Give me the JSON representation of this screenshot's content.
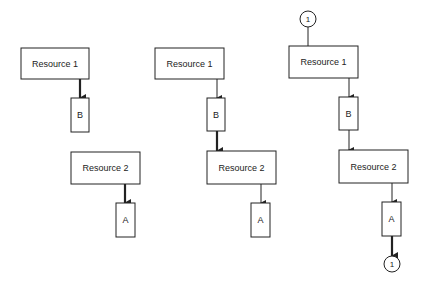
{
  "diagram": {
    "colors": {
      "stroke": "#222222",
      "background": "#ffffff"
    },
    "panels": [
      {
        "id": "left",
        "nodes": [
          {
            "id": "l-r1",
            "type": "resource",
            "label": "Resource 1",
            "x": 21,
            "y": 48,
            "w": 68,
            "h": 31
          },
          {
            "id": "l-b",
            "type": "task",
            "label": "B",
            "x": 71,
            "y": 98,
            "w": 18,
            "h": 34
          },
          {
            "id": "l-r2",
            "type": "resource",
            "label": "Resource 2",
            "x": 71,
            "y": 152,
            "w": 69,
            "h": 32
          },
          {
            "id": "l-a",
            "type": "task",
            "label": "A",
            "x": 116,
            "y": 203,
            "w": 19,
            "h": 34
          }
        ],
        "edges": [
          {
            "from": "l-r1",
            "to": "l-b",
            "x": 80,
            "y1": 79,
            "y2": 98,
            "thick": true
          },
          {
            "from": "l-r2",
            "to": "l-a",
            "x": 125,
            "y1": 184,
            "y2": 203,
            "thick": true
          }
        ]
      },
      {
        "id": "middle",
        "nodes": [
          {
            "id": "m-r1",
            "type": "resource",
            "label": "Resource 1",
            "x": 155,
            "y": 48,
            "w": 69,
            "h": 31
          },
          {
            "id": "m-b",
            "type": "task",
            "label": "B",
            "x": 207,
            "y": 98,
            "w": 18,
            "h": 33
          },
          {
            "id": "m-r2",
            "type": "resource",
            "label": "Resource 2",
            "x": 207,
            "y": 151,
            "w": 69,
            "h": 33
          },
          {
            "id": "m-a",
            "type": "task",
            "label": "A",
            "x": 251,
            "y": 203,
            "w": 19,
            "h": 34
          }
        ],
        "edges": [
          {
            "from": "m-r1",
            "to": "m-b",
            "x": 217,
            "y1": 79,
            "y2": 98,
            "thick": false
          },
          {
            "from": "m-b",
            "to": "m-r2",
            "x": 217,
            "y1": 131,
            "y2": 151,
            "thick": true
          },
          {
            "from": "m-r2",
            "to": "m-a",
            "x": 261,
            "y1": 184,
            "y2": 203,
            "thick": false
          }
        ]
      },
      {
        "id": "right",
        "connectors": [
          {
            "id": "c-top",
            "label": "1",
            "cx": 308,
            "cy": 19,
            "r": 8
          },
          {
            "id": "c-bottom",
            "label": "1",
            "cx": 392,
            "cy": 264,
            "r": 8
          }
        ],
        "nodes": [
          {
            "id": "r-r1",
            "type": "resource",
            "label": "Resource 1",
            "x": 289,
            "y": 46,
            "w": 69,
            "h": 32
          },
          {
            "id": "r-b",
            "type": "task",
            "label": "B",
            "x": 339,
            "y": 97,
            "w": 19,
            "h": 33
          },
          {
            "id": "r-r2",
            "type": "resource",
            "label": "Resource 2",
            "x": 339,
            "y": 150,
            "w": 69,
            "h": 33
          },
          {
            "id": "r-a",
            "type": "task",
            "label": "A",
            "x": 382,
            "y": 202,
            "w": 19,
            "h": 34
          }
        ],
        "edges": [
          {
            "from": "c-top",
            "to": "r-r1",
            "x": 308,
            "y1": 27,
            "y2": 46,
            "thick": false,
            "arrow": false
          },
          {
            "from": "r-r1",
            "to": "r-b",
            "x": 349,
            "y1": 78,
            "y2": 97,
            "thick": false
          },
          {
            "from": "r-b",
            "to": "r-r2",
            "x": 349,
            "y1": 130,
            "y2": 150,
            "thick": false
          },
          {
            "from": "r-r2",
            "to": "r-a",
            "x": 392,
            "y1": 183,
            "y2": 202,
            "thick": false
          },
          {
            "from": "r-a",
            "to": "c-bottom",
            "x": 392,
            "y1": 236,
            "y2": 256,
            "thick": true
          }
        ]
      }
    ]
  }
}
